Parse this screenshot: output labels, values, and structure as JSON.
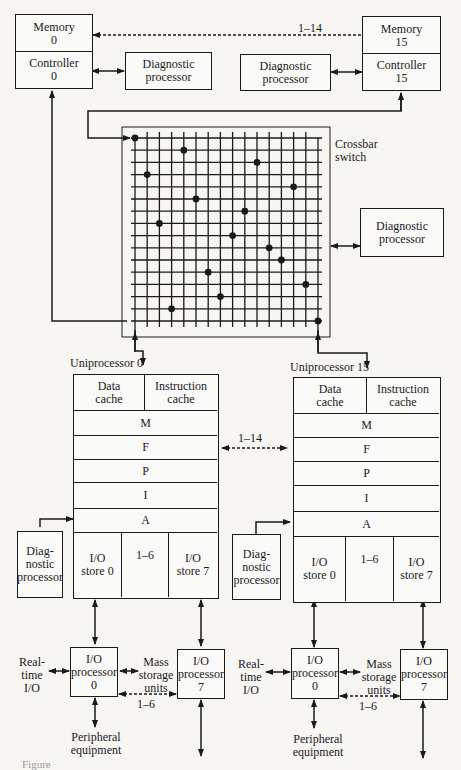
{
  "top": {
    "memory_0": "Memory\n0",
    "controller_0": "Controller\n0",
    "memory_15": "Memory\n15",
    "controller_15": "Controller\n15",
    "diag_left": "Diagnostic\nprocessor",
    "diag_right": "Diagnostic\nprocessor",
    "link_label": "1–14"
  },
  "crossbar": {
    "label": "Crossbar\nswitch",
    "diag": "Diagnostic\nprocessor",
    "rows": 16,
    "cols": 16,
    "crosspoints": [
      [
        0,
        0
      ],
      [
        4,
        1
      ],
      [
        10,
        2
      ],
      [
        1,
        3
      ],
      [
        13,
        4
      ],
      [
        5,
        5
      ],
      [
        9,
        6
      ],
      [
        2,
        7
      ],
      [
        8,
        8
      ],
      [
        11,
        9
      ],
      [
        12,
        10
      ],
      [
        6,
        11
      ],
      [
        14,
        12
      ],
      [
        7,
        13
      ],
      [
        3,
        14
      ],
      [
        15,
        15
      ]
    ]
  },
  "uniprocessors": [
    {
      "title": "Uniprocessor 0",
      "data_cache": "Data\ncache",
      "instruction_cache": "Instruction\ncache",
      "stages": [
        "M",
        "F",
        "P",
        "I",
        "A"
      ],
      "io_store_0": "I/O\nstore 0",
      "io_store_7": "I/O\nstore 7",
      "io_link": "1–6",
      "diag": "Diag-\nnostic\nprocessor",
      "io_proc_0": "I/O\nprocessor\n0",
      "io_proc_7": "I/O\nprocessor\n7",
      "realtime": "Real-\ntime\nI/O",
      "mass": "Mass\nstorage\nunits",
      "peripheral": "Peripheral\nequipment",
      "proc_link": "1–6"
    },
    {
      "title": "Uniprocessor 15",
      "data_cache": "Data\ncache",
      "instruction_cache": "Instruction\ncache",
      "stages": [
        "M",
        "F",
        "P",
        "I",
        "A"
      ],
      "io_store_0": "I/O\nstore 0",
      "io_store_7": "I/O\nstore 7",
      "io_link": "1–6",
      "diag": "Diag-\nnostic\nprocessor",
      "io_proc_0": "I/O\nprocessor\n0",
      "io_proc_7": "I/O\nprocessor\n7",
      "realtime": "Real-\ntime\nI/O",
      "mass": "Mass\nstorage\nunits",
      "peripheral": "Peripheral\nequipment",
      "proc_link": "1–6"
    }
  ],
  "uni_link_label": "1–14",
  "caption": "Figure"
}
